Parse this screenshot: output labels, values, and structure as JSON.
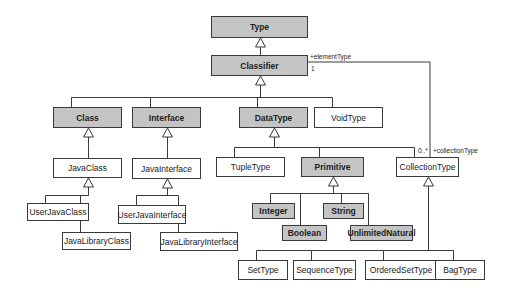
{
  "diagram": {
    "type": "uml-class-hierarchy",
    "colors": {
      "abstract_fill": "#c4c4c4",
      "concrete_fill": "#ffffff",
      "stroke": "#3a3a3a"
    },
    "classes": [
      {
        "id": "type",
        "label": "Type",
        "style": "abstract",
        "x": 211,
        "y": 16,
        "w": 97,
        "h": 22
      },
      {
        "id": "classifier",
        "label": "Classifier",
        "style": "abstract",
        "x": 211,
        "y": 55,
        "w": 97,
        "h": 21
      },
      {
        "id": "class",
        "label": "Class",
        "style": "abstract",
        "x": 53,
        "y": 107,
        "w": 69,
        "h": 21
      },
      {
        "id": "interface",
        "label": "Interface",
        "style": "abstract",
        "x": 132,
        "y": 107,
        "w": 69,
        "h": 21
      },
      {
        "id": "datatype",
        "label": "DataType",
        "style": "abstract",
        "x": 239,
        "y": 107,
        "w": 69,
        "h": 21
      },
      {
        "id": "voidtype",
        "label": "VoidType",
        "style": "concrete",
        "x": 314,
        "y": 107,
        "w": 69,
        "h": 21
      },
      {
        "id": "javaclass",
        "label": "JavaClass",
        "style": "concrete",
        "x": 53,
        "y": 158,
        "w": 69,
        "h": 20
      },
      {
        "id": "javainterface",
        "label": "JavaInterface",
        "style": "concrete",
        "x": 132,
        "y": 158,
        "w": 69,
        "h": 21
      },
      {
        "id": "tupletype",
        "label": "TupleType",
        "style": "concrete",
        "x": 216,
        "y": 157,
        "w": 69,
        "h": 20
      },
      {
        "id": "primitive",
        "label": "Primitive",
        "style": "abstract",
        "x": 301,
        "y": 157,
        "w": 63,
        "h": 20
      },
      {
        "id": "collectiontype",
        "label": "CollectionType",
        "style": "concrete",
        "x": 396,
        "y": 157,
        "w": 63,
        "h": 20
      },
      {
        "id": "userjavaclass",
        "label": "UserJavaClass",
        "style": "concrete",
        "x": 27,
        "y": 203,
        "w": 62,
        "h": 18
      },
      {
        "id": "userjavainterface",
        "label": "UserJavaInterface",
        "style": "concrete",
        "x": 118,
        "y": 205,
        "w": 68,
        "h": 19
      },
      {
        "id": "javalibraryclass",
        "label": "JavaLibraryClass",
        "style": "concrete",
        "x": 62,
        "y": 232,
        "w": 69,
        "h": 18
      },
      {
        "id": "javalibraryinterface",
        "label": "JavaLibraryInterface",
        "style": "concrete",
        "x": 160,
        "y": 232,
        "w": 78,
        "h": 19
      },
      {
        "id": "integer",
        "label": "Integer",
        "style": "abstract",
        "x": 252,
        "y": 203,
        "w": 43,
        "h": 16
      },
      {
        "id": "string",
        "label": "String",
        "style": "abstract",
        "x": 323,
        "y": 203,
        "w": 41,
        "h": 16
      },
      {
        "id": "boolean",
        "label": "Boolean",
        "style": "abstract",
        "x": 282,
        "y": 225,
        "w": 45,
        "h": 16
      },
      {
        "id": "unlimitednatural",
        "label": "UnlimitedNatural",
        "style": "abstract",
        "x": 350,
        "y": 225,
        "w": 63,
        "h": 16
      },
      {
        "id": "settype",
        "label": "SetType",
        "style": "concrete",
        "x": 238,
        "y": 260,
        "w": 50,
        "h": 20
      },
      {
        "id": "sequencetype",
        "label": "SequenceType",
        "style": "concrete",
        "x": 293,
        "y": 260,
        "w": 63,
        "h": 20
      },
      {
        "id": "orderedsettype",
        "label": "OrderedSetType",
        "style": "concrete",
        "x": 365,
        "y": 260,
        "w": 72,
        "h": 20
      },
      {
        "id": "bagtype",
        "label": "BagType",
        "style": "concrete",
        "x": 435,
        "y": 260,
        "w": 50,
        "h": 20
      }
    ],
    "generalizations": [
      {
        "parent": "type",
        "children": [
          "classifier"
        ],
        "bus_y": 47
      },
      {
        "parent": "classifier",
        "children": [
          "class",
          "interface",
          "datatype",
          "voidtype"
        ],
        "bus_y": 97
      },
      {
        "parent": "class",
        "children": [
          "javaclass"
        ],
        "bus_y": 145
      },
      {
        "parent": "interface",
        "children": [
          "javainterface"
        ],
        "bus_y": 145
      },
      {
        "parent": "datatype",
        "children": [
          "tupletype",
          "primitive",
          "collectiontype"
        ],
        "bus_y": 147
      },
      {
        "parent": "javaclass",
        "children": [
          "userjavaclass",
          "javalibraryclass"
        ],
        "bus_y": 195
      },
      {
        "parent": "javainterface",
        "children": [
          "userjavainterface",
          "javalibraryinterface"
        ],
        "bus_y": 195
      },
      {
        "parent": "primitive",
        "children": [
          "integer",
          "string",
          "boolean",
          "unlimitednatural"
        ],
        "bus_y": 193
      },
      {
        "parent": "collectiontype",
        "children": [
          "settype",
          "sequencetype",
          "orderedsettype",
          "bagtype"
        ],
        "bus_y": 250
      }
    ],
    "association": {
      "from": "classifier",
      "to": "collectiontype",
      "path": [
        [
          308,
          62
        ],
        [
          430,
          62
        ],
        [
          430,
          157
        ]
      ],
      "labels": [
        {
          "text": "+elementType",
          "x": 310,
          "y": 53
        },
        {
          "text": "1",
          "x": 311,
          "y": 65
        },
        {
          "text": "0..*",
          "x": 418,
          "y": 147
        },
        {
          "text": "+collectionType",
          "x": 433,
          "y": 147
        }
      ]
    }
  }
}
